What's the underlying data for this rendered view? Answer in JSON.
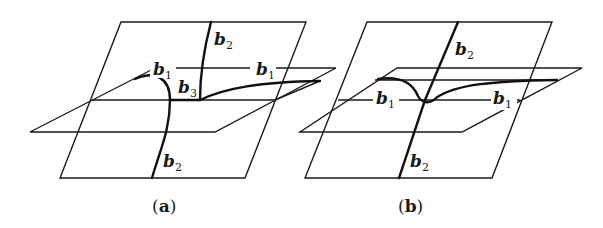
{
  "figure": {
    "panels": [
      {
        "id": "a",
        "caption_open": "(",
        "caption_letter": "a",
        "caption_close": ")",
        "labels": {
          "b2_top": {
            "base": "b",
            "sub": "2"
          },
          "b1_left": {
            "base": "b",
            "sub": "1"
          },
          "b1_right": {
            "base": "b",
            "sub": "1"
          },
          "b3": {
            "base": "b",
            "sub": "3"
          },
          "b2_bottom": {
            "base": "b",
            "sub": "2"
          }
        }
      },
      {
        "id": "b",
        "caption_open": "(",
        "caption_letter": "b",
        "caption_close": ")",
        "labels": {
          "b2_top": {
            "base": "b",
            "sub": "2"
          },
          "b1_left": {
            "base": "b",
            "sub": "1"
          },
          "b1_right": {
            "base": "b",
            "sub": "1"
          },
          "b2_bottom": {
            "base": "b",
            "sub": "2"
          }
        }
      }
    ],
    "colors": {
      "line": "#1a1a1a",
      "background": "#ffffff"
    }
  }
}
